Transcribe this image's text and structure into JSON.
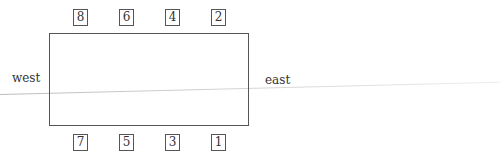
{
  "diagram": {
    "type": "seating-layout",
    "table": {
      "shape": "rectangle"
    },
    "directions": {
      "west": "west",
      "east": "east"
    },
    "top_row_seats": [
      "8",
      "6",
      "4",
      "2"
    ],
    "bottom_row_seats": [
      "7",
      "5",
      "3",
      "1"
    ],
    "footer_text": ""
  }
}
